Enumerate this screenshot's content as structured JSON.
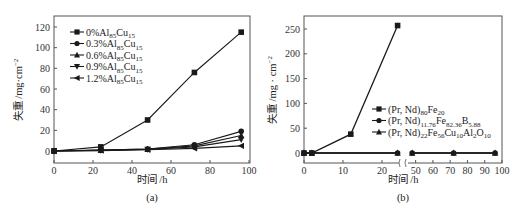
{
  "chart_data": [
    {
      "panel": "(a)",
      "type": "line",
      "xlabel": "时间 /h",
      "ylabel": "失重 /mg·cm⁻²",
      "xlim": [
        0,
        100
      ],
      "ylim": [
        -6,
        130
      ],
      "xticks": [
        0,
        20,
        40,
        60,
        80,
        100
      ],
      "yticks": [
        0,
        20,
        40,
        60,
        80,
        100,
        120
      ],
      "grid": false,
      "legend_position": "upper left",
      "x": [
        0,
        24,
        48,
        72,
        96
      ],
      "series": [
        {
          "name": "0%Al85Cu15",
          "label_main": "0%Al",
          "sub1": "85",
          "mid": "Cu",
          "sub2": "15",
          "marker": "square",
          "values": [
            0,
            4,
            30,
            76,
            115
          ]
        },
        {
          "name": "0.3%Al85Cu15",
          "label_main": "0.3%Al",
          "sub1": "85",
          "mid": "Cu",
          "sub2": "15",
          "marker": "circle",
          "values": [
            0,
            1,
            2,
            6,
            19
          ]
        },
        {
          "name": "0.6%Al85Cu15",
          "label_main": "0.6%Al",
          "sub1": "85",
          "mid": "Cu",
          "sub2": "15",
          "marker": "triangle-up",
          "values": [
            0,
            0.8,
            1.8,
            5,
            15
          ]
        },
        {
          "name": "0.9%Al85Cu15",
          "label_main": "0.9%Al",
          "sub1": "85",
          "mid": "Cu",
          "sub2": "15",
          "marker": "triangle-down",
          "values": [
            0,
            0.6,
            1.5,
            4,
            11
          ]
        },
        {
          "name": "1.2%Al85Cu15",
          "label_main": "1.2%Al",
          "sub1": "85",
          "mid": "Cu",
          "sub2": "15",
          "marker": "triangle-left",
          "values": [
            0,
            0.4,
            1.2,
            2.5,
            5
          ]
        }
      ]
    },
    {
      "panel": "(b)",
      "type": "line",
      "xlabel": "时间 /h",
      "ylabel": "失重 /mg·cm⁻²",
      "xlim": [
        0,
        100
      ],
      "axis_break": [
        25,
        45
      ],
      "ylim": [
        -10,
        275
      ],
      "xticks": [
        0,
        10,
        20,
        50,
        60,
        70,
        80,
        90,
        100
      ],
      "yticks": [
        0,
        50,
        100,
        150,
        200,
        250
      ],
      "grid": false,
      "legend_position": "center right",
      "series": [
        {
          "name": "(Pr, Nd)80Fe20",
          "marker": "square",
          "x": [
            0,
            2,
            12,
            24
          ],
          "values": [
            0,
            0,
            38,
            257
          ],
          "parts": [
            [
              "(Pr, Nd)",
              ""
            ],
            [
              "80",
              "sub"
            ],
            [
              "Fe",
              ""
            ],
            [
              "20",
              "sub"
            ]
          ]
        },
        {
          "name": "(Pr, Nd)11.76Fe82.36B5.88",
          "marker": "circle",
          "x": [
            0,
            2,
            24,
            48,
            72,
            96
          ],
          "values": [
            0,
            0,
            0,
            0,
            0,
            0
          ],
          "parts": [
            [
              "(Pr, Nd)",
              ""
            ],
            [
              "11.76",
              "sub"
            ],
            [
              "Fe",
              ""
            ],
            [
              "82.36",
              "sub"
            ],
            [
              "B",
              ""
            ],
            [
              "5.88",
              "sub"
            ]
          ]
        },
        {
          "name": "(Pr, Nd)22Fe56Cu10Al2O10",
          "marker": "triangle-up",
          "x": [
            0,
            2,
            24,
            48,
            72,
            96
          ],
          "values": [
            0,
            0,
            0,
            0,
            0,
            0
          ],
          "parts": [
            [
              "(Pr, Nd)",
              ""
            ],
            [
              "22",
              "sub"
            ],
            [
              "Fe",
              ""
            ],
            [
              "56",
              "sub"
            ],
            [
              "Cu",
              ""
            ],
            [
              "10",
              "sub"
            ],
            [
              "Al",
              ""
            ],
            [
              "2",
              "sub"
            ],
            [
              "O",
              ""
            ],
            [
              "10",
              "sub"
            ]
          ]
        }
      ]
    }
  ],
  "captions": {
    "a": "(a)",
    "b": "(b)"
  },
  "axis": {
    "xlabel_a": "时间 /h",
    "xlabel_b": "时间 /h",
    "ylabel_a": "失重 /mg·cm",
    "ylabel_b": "失重 /mg · cm",
    "ylabel_exp": "−2"
  },
  "colors": {
    "line": "#1a1a1a",
    "frame": "#555555",
    "text": "#222222"
  }
}
